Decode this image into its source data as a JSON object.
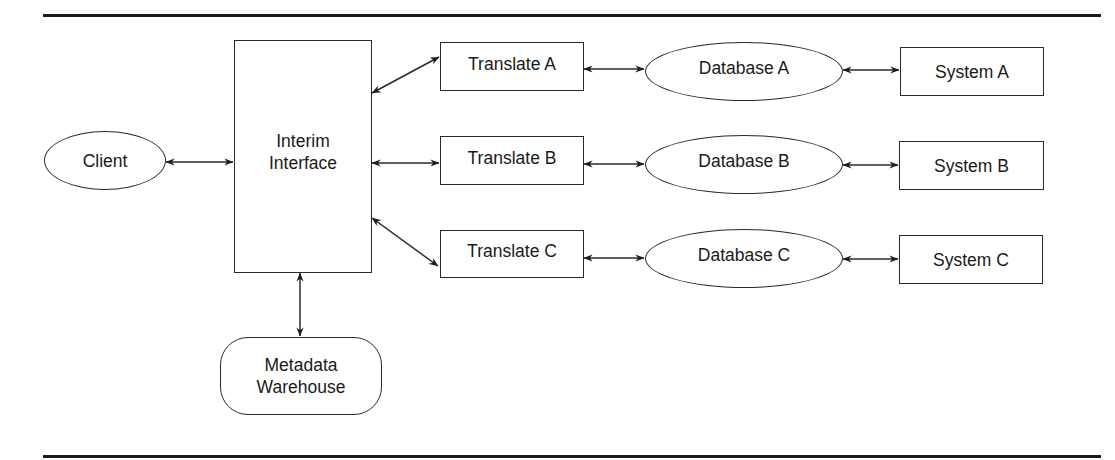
{
  "diagram": {
    "nodes": {
      "client": {
        "label": "Client",
        "shape": "ellipse"
      },
      "interim": {
        "label": "Interim\nInterface",
        "shape": "rectangle"
      },
      "metadata": {
        "label": "Metadata\nWarehouse",
        "shape": "rounded-rectangle"
      },
      "translate_a": {
        "label": "Translate A",
        "shape": "rectangle"
      },
      "translate_b": {
        "label": "Translate B",
        "shape": "rectangle"
      },
      "translate_c": {
        "label": "Translate C",
        "shape": "rectangle"
      },
      "database_a": {
        "label": "Database A",
        "shape": "ellipse"
      },
      "database_b": {
        "label": "Database B",
        "shape": "ellipse"
      },
      "database_c": {
        "label": "Database C",
        "shape": "ellipse"
      },
      "system_a": {
        "label": "System A",
        "shape": "rectangle"
      },
      "system_b": {
        "label": "System B",
        "shape": "rectangle"
      },
      "system_c": {
        "label": "System C",
        "shape": "rectangle"
      }
    },
    "edges": [
      {
        "from": "client",
        "to": "interim",
        "direction": "bidirectional"
      },
      {
        "from": "interim",
        "to": "metadata",
        "direction": "bidirectional"
      },
      {
        "from": "interim",
        "to": "translate_a",
        "direction": "bidirectional"
      },
      {
        "from": "interim",
        "to": "translate_b",
        "direction": "bidirectional"
      },
      {
        "from": "interim",
        "to": "translate_c",
        "direction": "bidirectional"
      },
      {
        "from": "translate_a",
        "to": "database_a",
        "direction": "bidirectional"
      },
      {
        "from": "translate_b",
        "to": "database_b",
        "direction": "bidirectional"
      },
      {
        "from": "translate_c",
        "to": "database_c",
        "direction": "bidirectional"
      },
      {
        "from": "database_a",
        "to": "system_a",
        "direction": "bidirectional"
      },
      {
        "from": "database_b",
        "to": "system_b",
        "direction": "bidirectional"
      },
      {
        "from": "database_c",
        "to": "system_c",
        "direction": "bidirectional"
      }
    ]
  },
  "colors": {
    "stroke": "#2a2a2a",
    "rule": "#1c1c1c",
    "background": "#ffffff",
    "text": "#1a1a1a"
  }
}
